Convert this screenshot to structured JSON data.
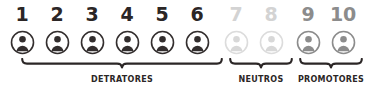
{
  "widget": {
    "name": "nps-rating-scale",
    "background": "#ffffff"
  },
  "colors": {
    "detractor_dark": "#332e2e",
    "neutral_light": "#d8d8d8",
    "promoter_mid": "#8c8c8c",
    "number_dark": "#2b2626",
    "number_light": "#d3d3d3",
    "number_mid": "#8c8c8c",
    "bracket": "#2b2626",
    "label": "#2b2626"
  },
  "scale": {
    "points": [
      {
        "number": "1",
        "tone": "dark",
        "icon": "person-circle-icon",
        "group": "detratores"
      },
      {
        "number": "2",
        "tone": "dark",
        "icon": "person-circle-icon",
        "group": "detratores"
      },
      {
        "number": "3",
        "tone": "dark",
        "icon": "person-circle-icon",
        "group": "detratores"
      },
      {
        "number": "4",
        "tone": "dark",
        "icon": "person-circle-icon",
        "group": "detratores"
      },
      {
        "number": "5",
        "tone": "dark",
        "icon": "person-circle-icon",
        "group": "detratores"
      },
      {
        "number": "6",
        "tone": "dark",
        "icon": "person-circle-icon",
        "group": "detratores"
      },
      {
        "number": "7",
        "tone": "light",
        "icon": "person-circle-icon",
        "group": "neutros"
      },
      {
        "number": "8",
        "tone": "light",
        "icon": "person-circle-icon",
        "group": "neutros"
      },
      {
        "number": "9",
        "tone": "mid",
        "icon": "person-circle-icon",
        "group": "promotores"
      },
      {
        "number": "10",
        "tone": "mid",
        "icon": "person-circle-icon",
        "group": "promotores"
      }
    ]
  },
  "groups": [
    {
      "id": "detratores",
      "label": "DETRATORES",
      "range": "1-6",
      "bracket_left": 21,
      "bracket_width": 202
    },
    {
      "id": "neutros",
      "label": "NEUTROS",
      "range": "7-8",
      "bracket_left": 229,
      "bracket_width": 64
    },
    {
      "id": "promotores",
      "label": "PROMOTORES",
      "range": "9-10",
      "bracket_left": 299,
      "bracket_width": 64
    }
  ]
}
